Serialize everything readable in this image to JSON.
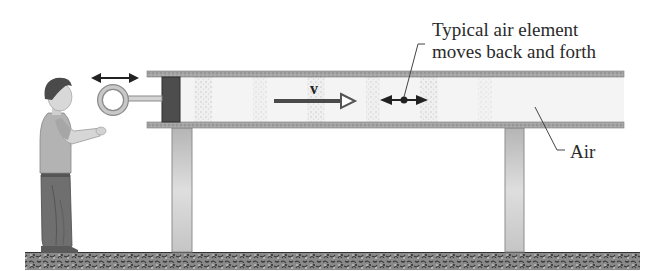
{
  "diagram": {
    "annotation_line1": "Typical air element",
    "annotation_line2": "moves back and forth",
    "air_label": "Air",
    "velocity_label": "v"
  },
  "colors": {
    "tube_wall": "#9a9a9a",
    "piston": "#4a4a4a",
    "air_fill": "#f2f2f2",
    "compression": "#dcdcdc",
    "leg": "#c4c4c4",
    "ground": "#7a7a7a",
    "arrow": "#333333",
    "text": "#2a2a2a"
  }
}
